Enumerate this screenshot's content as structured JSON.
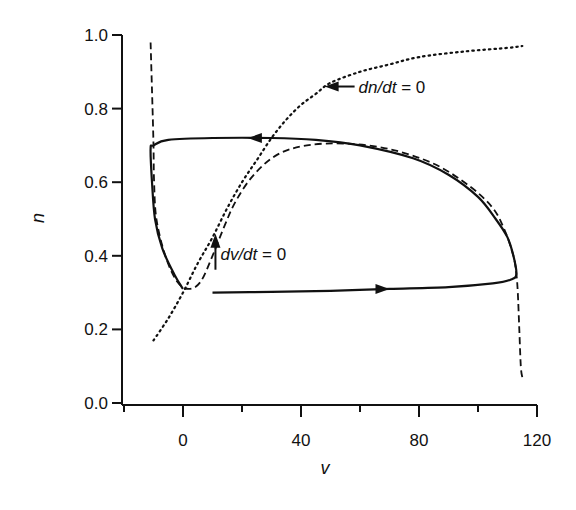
{
  "chart_data": {
    "type": "line",
    "title": "",
    "xlabel": "v",
    "ylabel": "n",
    "xlim": [
      -20,
      120
    ],
    "ylim": [
      0.0,
      1.0
    ],
    "x_ticks": [
      -20,
      0,
      20,
      40,
      60,
      80,
      100,
      120
    ],
    "x_tick_labels": [
      "0",
      "40",
      "80",
      "120"
    ],
    "x_tick_label_values": [
      0,
      40,
      80,
      120
    ],
    "y_ticks": [
      0.0,
      0.2,
      0.4,
      0.6,
      0.8,
      1.0
    ],
    "y_tick_labels": [
      "0.0",
      "0.2",
      "0.4",
      "0.6",
      "0.8",
      "1.0"
    ],
    "grid": false,
    "legend": null,
    "series": [
      {
        "name": "trajectory (limit cycle)",
        "style": "solid",
        "points": [
          [
            10,
            0.3
          ],
          [
            30,
            0.302
          ],
          [
            50,
            0.305
          ],
          [
            70,
            0.31
          ],
          [
            90,
            0.315
          ],
          [
            105,
            0.325
          ],
          [
            111,
            0.335
          ],
          [
            113,
            0.35
          ],
          [
            112,
            0.4
          ],
          [
            110,
            0.45
          ],
          [
            106,
            0.5
          ],
          [
            100,
            0.56
          ],
          [
            90,
            0.62
          ],
          [
            78,
            0.665
          ],
          [
            60,
            0.7
          ],
          [
            45,
            0.715
          ],
          [
            30,
            0.72
          ],
          [
            10,
            0.72
          ],
          [
            -5,
            0.715
          ],
          [
            -10,
            0.7
          ],
          [
            -11,
            0.69
          ],
          [
            -10.5,
            0.6
          ],
          [
            -9.5,
            0.5
          ],
          [
            -7,
            0.42
          ],
          [
            -3,
            0.35
          ],
          [
            0,
            0.31
          ]
        ]
      },
      {
        "name": "dv/dt = 0",
        "style": "dashed",
        "points": [
          [
            -11,
            0.98
          ],
          [
            -10.5,
            0.85
          ],
          [
            -10,
            0.7
          ],
          [
            -9.8,
            0.6
          ],
          [
            -9,
            0.5
          ],
          [
            -6,
            0.4
          ],
          [
            -2,
            0.33
          ],
          [
            2,
            0.31
          ],
          [
            6,
            0.33
          ],
          [
            10,
            0.4
          ],
          [
            14,
            0.48
          ],
          [
            18,
            0.55
          ],
          [
            24,
            0.62
          ],
          [
            32,
            0.675
          ],
          [
            42,
            0.7
          ],
          [
            55,
            0.705
          ],
          [
            70,
            0.69
          ],
          [
            85,
            0.65
          ],
          [
            97,
            0.59
          ],
          [
            105,
            0.53
          ],
          [
            109,
            0.47
          ],
          [
            112,
            0.4
          ],
          [
            113,
            0.35
          ],
          [
            113.5,
            0.3
          ],
          [
            114,
            0.2
          ],
          [
            114.5,
            0.1
          ],
          [
            115,
            0.07
          ]
        ]
      },
      {
        "name": "dn/dt = 0",
        "style": "dotted",
        "points": [
          [
            -10,
            0.17
          ],
          [
            -5,
            0.23
          ],
          [
            0,
            0.3
          ],
          [
            5,
            0.38
          ],
          [
            10,
            0.45
          ],
          [
            15,
            0.53
          ],
          [
            20,
            0.6
          ],
          [
            25,
            0.66
          ],
          [
            30,
            0.72
          ],
          [
            35,
            0.77
          ],
          [
            40,
            0.81
          ],
          [
            45,
            0.84
          ],
          [
            50,
            0.87
          ],
          [
            60,
            0.9
          ],
          [
            70,
            0.92
          ],
          [
            80,
            0.94
          ],
          [
            95,
            0.955
          ],
          [
            110,
            0.965
          ],
          [
            115,
            0.97
          ]
        ]
      }
    ],
    "annotations": [
      {
        "text_italic": "dn/dt",
        "text_rest": " = 0",
        "at": [
          60,
          0.86
        ],
        "arrow_to": [
          48,
          0.86
        ],
        "arrow_dir": "left"
      },
      {
        "text_italic": "dv/dt",
        "text_rest": " = 0",
        "at": [
          12,
          0.4
        ],
        "arrow_to": [
          11,
          0.46
        ],
        "arrow_dir": "up"
      }
    ],
    "direction_arrows": [
      {
        "on": "trajectory (limit cycle)",
        "at": [
          22,
          0.72
        ],
        "dir": "left"
      },
      {
        "on": "trajectory (limit cycle)",
        "at": [
          70,
          0.31
        ],
        "dir": "right"
      }
    ]
  }
}
